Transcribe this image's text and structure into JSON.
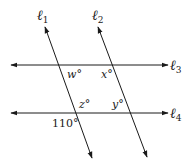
{
  "diagram": {
    "type": "parallel-lines-transversals",
    "lines": {
      "l1": {
        "label": "ℓ",
        "sub": "1",
        "orientation": "transversal"
      },
      "l2": {
        "label": "ℓ",
        "sub": "2",
        "orientation": "transversal"
      },
      "l3": {
        "label": "ℓ",
        "sub": "3",
        "orientation": "horizontal"
      },
      "l4": {
        "label": "ℓ",
        "sub": "4",
        "orientation": "horizontal"
      }
    },
    "angles": {
      "w": "w°",
      "x": "x°",
      "z": "z°",
      "y": "y°",
      "given": "110°"
    },
    "colors": {
      "stroke": "#1a1a1a",
      "background": "#ffffff"
    }
  }
}
